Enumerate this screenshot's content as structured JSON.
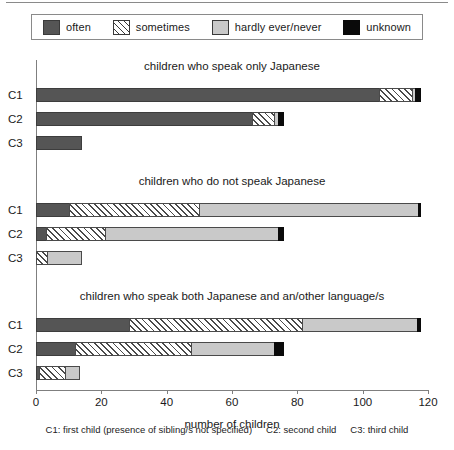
{
  "legend": {
    "items": [
      {
        "label": "often",
        "key": "often",
        "color": "#555555"
      },
      {
        "label": "sometimes",
        "key": "sometimes",
        "color": "#ffffff"
      },
      {
        "label": "hardly ever/never",
        "key": "hardly",
        "color": "#c9c9c9"
      },
      {
        "label": "unknown",
        "key": "unknown",
        "color": "#0a0a0a"
      }
    ]
  },
  "axis": {
    "xtitle": "number of children",
    "ticks": [
      "0",
      "20",
      "40",
      "60",
      "80",
      "100",
      "120"
    ]
  },
  "footer": {
    "c1": "C1: first child (presence of sibling/s not specified)",
    "c2": "C2: second child",
    "c3": "C3: third child"
  },
  "groups": [
    {
      "title": "children who speak only Japanese",
      "rows": [
        {
          "label": "C1",
          "values": {
            "often": 105,
            "sometimes": 10,
            "hardly": 1,
            "unknown": 2
          }
        },
        {
          "label": "C2",
          "values": {
            "often": 66,
            "sometimes": 7,
            "hardly": 1,
            "unknown": 2
          }
        },
        {
          "label": "C3",
          "values": {
            "often": 14,
            "sometimes": 0,
            "hardly": 0,
            "unknown": 0
          }
        }
      ]
    },
    {
      "title": "children who do not speak Japanese",
      "rows": [
        {
          "label": "C1",
          "values": {
            "often": 10,
            "sometimes": 40,
            "hardly": 67,
            "unknown": 1
          }
        },
        {
          "label": "C2",
          "values": {
            "often": 3,
            "sometimes": 18,
            "hardly": 53,
            "unknown": 2
          }
        },
        {
          "label": "C3",
          "values": {
            "often": 0,
            "sometimes": 3.5,
            "hardly": 10.5,
            "unknown": 0
          }
        }
      ]
    },
    {
      "title": "children who speak both Japanese and an/other language/s",
      "rows": [
        {
          "label": "C1",
          "values": {
            "often": 28.5,
            "sometimes": 53,
            "hardly": 35,
            "unknown": 1.5
          }
        },
        {
          "label": "C2",
          "values": {
            "often": 12,
            "sometimes": 35.5,
            "hardly": 25.5,
            "unknown": 3
          }
        },
        {
          "label": "C3",
          "values": {
            "often": 1,
            "sometimes": 8,
            "hardly": 4.5,
            "unknown": 0
          }
        }
      ]
    }
  ],
  "chart_data": {
    "type": "bar",
    "orientation": "horizontal",
    "stacked": true,
    "title": "",
    "xlabel": "number of children",
    "ylabel": "",
    "xlim": [
      0,
      120
    ],
    "xticks": [
      0,
      20,
      40,
      60,
      80,
      100,
      120
    ],
    "grid": false,
    "legend_position": "top",
    "series": [
      {
        "name": "often",
        "color": "#555555"
      },
      {
        "name": "sometimes",
        "color": "#ffffff"
      },
      {
        "name": "hardly ever/never",
        "color": "#c9c9c9"
      },
      {
        "name": "unknown",
        "color": "#0a0a0a"
      }
    ],
    "panels": [
      {
        "title": "children who speak only Japanese",
        "categories": [
          "C1",
          "C2",
          "C3"
        ],
        "values": {
          "often": [
            105,
            66,
            14
          ],
          "sometimes": [
            10,
            7,
            0
          ],
          "hardly ever/never": [
            1,
            1,
            0
          ],
          "unknown": [
            2,
            2,
            0
          ]
        },
        "totals": [
          118,
          76,
          14
        ]
      },
      {
        "title": "children who do not speak Japanese",
        "categories": [
          "C1",
          "C2",
          "C3"
        ],
        "values": {
          "often": [
            10,
            3,
            0
          ],
          "sometimes": [
            40,
            18,
            3.5
          ],
          "hardly ever/never": [
            67,
            53,
            10.5
          ],
          "unknown": [
            1,
            2,
            0
          ]
        },
        "totals": [
          118,
          76,
          14
        ]
      },
      {
        "title": "children who speak both Japanese and an/other language/s",
        "categories": [
          "C1",
          "C2",
          "C3"
        ],
        "values": {
          "often": [
            28.5,
            12,
            1
          ],
          "sometimes": [
            53,
            35.5,
            8
          ],
          "hardly ever/never": [
            35,
            25.5,
            4.5
          ],
          "unknown": [
            1.5,
            3,
            0
          ]
        },
        "totals": [
          118,
          76,
          13.5
        ]
      }
    ]
  }
}
